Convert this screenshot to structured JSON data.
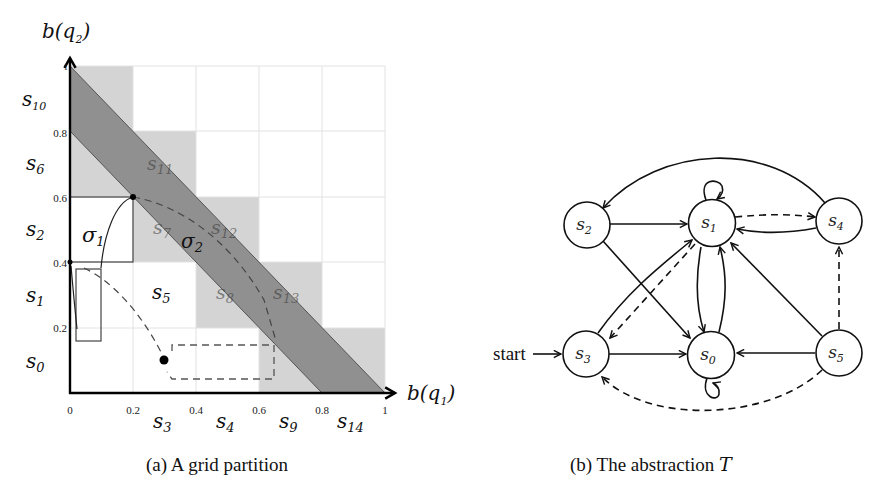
{
  "figure_a": {
    "caption": "(a)  A grid partition",
    "y_axis_label": "b(q",
    "y_axis_sub": "2",
    "x_axis_label": "b(q",
    "x_axis_sub": "1",
    "x_ticks": [
      "0",
      "0.2",
      "0.4",
      "0.6",
      "0.8",
      "1"
    ],
    "y_ticks": [
      "0.2",
      "0.4",
      "0.6",
      "0.8",
      "1"
    ],
    "left_state_labels": [
      {
        "base": "s",
        "sub": "10"
      },
      {
        "base": "s",
        "sub": "6"
      },
      {
        "base": "s",
        "sub": "2"
      },
      {
        "base": "s",
        "sub": "1"
      },
      {
        "base": "s",
        "sub": "0"
      }
    ],
    "bottom_state_labels": [
      {
        "base": "s",
        "sub": "3"
      },
      {
        "base": "s",
        "sub": "4"
      },
      {
        "base": "s",
        "sub": "9"
      },
      {
        "base": "s",
        "sub": "14"
      }
    ],
    "inner_state_labels": [
      {
        "base": "s",
        "sub": "11"
      },
      {
        "base": "s",
        "sub": "7"
      },
      {
        "base": "s",
        "sub": "12"
      },
      {
        "base": "s",
        "sub": "5"
      },
      {
        "base": "s",
        "sub": "8"
      },
      {
        "base": "s",
        "sub": "13"
      }
    ],
    "sigma_labels": [
      {
        "base": "σ",
        "sub": "1"
      },
      {
        "base": "σ",
        "sub": "2"
      }
    ],
    "colors": {
      "light_cell": "#d4d4d4",
      "band": "#8a8a8a",
      "grid_line": "#e2e2e2",
      "axis": "#000000"
    }
  },
  "figure_b": {
    "caption": "(b)  The abstraction ",
    "caption_symbol": "T",
    "start_label": "start",
    "nodes": [
      {
        "id": "s0",
        "base": "s",
        "sub": "0"
      },
      {
        "id": "s1",
        "base": "s",
        "sub": "1"
      },
      {
        "id": "s2",
        "base": "s",
        "sub": "2"
      },
      {
        "id": "s3",
        "base": "s",
        "sub": "3"
      },
      {
        "id": "s4",
        "base": "s",
        "sub": "4"
      },
      {
        "id": "s5",
        "base": "s",
        "sub": "5"
      }
    ],
    "edges": [
      {
        "from": "s1",
        "to": "s1",
        "style": "solid"
      },
      {
        "from": "s0",
        "to": "s0",
        "style": "solid"
      },
      {
        "from": "s2",
        "to": "s1",
        "style": "solid"
      },
      {
        "from": "s2",
        "to": "s0",
        "style": "solid"
      },
      {
        "from": "s3",
        "to": "s1",
        "style": "solid"
      },
      {
        "from": "s1",
        "to": "s3",
        "style": "dashed"
      },
      {
        "from": "s3",
        "to": "s0",
        "style": "solid"
      },
      {
        "from": "s1",
        "to": "s0",
        "style": "solid"
      },
      {
        "from": "s0",
        "to": "s1",
        "style": "solid"
      },
      {
        "from": "s1",
        "to": "s4",
        "style": "dashed"
      },
      {
        "from": "s4",
        "to": "s1",
        "style": "solid"
      },
      {
        "from": "s4",
        "to": "s2",
        "style": "solid"
      },
      {
        "from": "s5",
        "to": "s1",
        "style": "solid"
      },
      {
        "from": "s5",
        "to": "s0",
        "style": "solid"
      },
      {
        "from": "s5",
        "to": "s4",
        "style": "dashed"
      },
      {
        "from": "s5",
        "to": "s3",
        "style": "dashed"
      }
    ]
  }
}
